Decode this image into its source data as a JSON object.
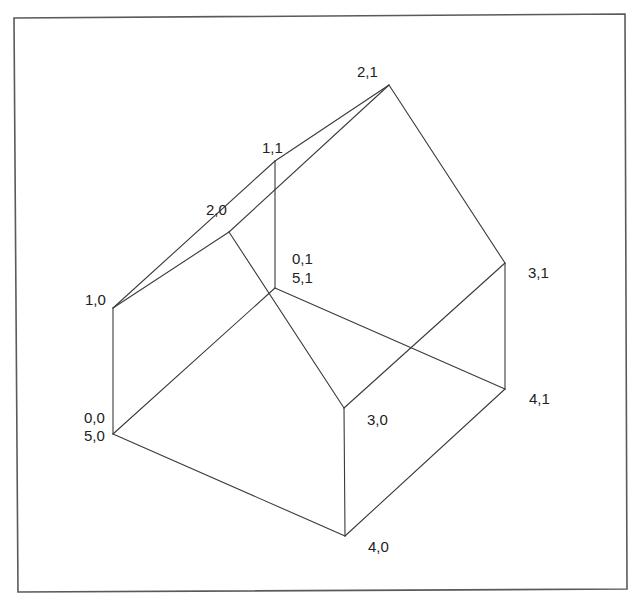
{
  "diagram": {
    "type": "wireframe-3d-house",
    "frame": {
      "points": [
        [
          14,
          18
        ],
        [
          625,
          14
        ],
        [
          627,
          589
        ],
        [
          18,
          592
        ]
      ],
      "stroke": "#5a5a5a"
    },
    "line_color": "#3a3a3a",
    "text_color": "#222222",
    "vertices": [
      {
        "id": "0,0",
        "x": 113,
        "y": 434
      },
      {
        "id": "1,0",
        "x": 113,
        "y": 308
      },
      {
        "id": "2,0",
        "x": 229,
        "y": 232
      },
      {
        "id": "3,0",
        "x": 344,
        "y": 408
      },
      {
        "id": "4,0",
        "x": 345,
        "y": 536
      },
      {
        "id": "0,1",
        "x": 275,
        "y": 288
      },
      {
        "id": "1,1",
        "x": 275,
        "y": 161
      },
      {
        "id": "2,1",
        "x": 389,
        "y": 85
      },
      {
        "id": "3,1",
        "x": 505,
        "y": 263
      },
      {
        "id": "4,1",
        "x": 505,
        "y": 389
      }
    ],
    "edges": [
      [
        "0,0",
        "1,0"
      ],
      [
        "1,0",
        "2,0"
      ],
      [
        "2,0",
        "3,0"
      ],
      [
        "3,0",
        "4,0"
      ],
      [
        "4,0",
        "0,0"
      ],
      [
        "0,1",
        "1,1"
      ],
      [
        "1,1",
        "2,1"
      ],
      [
        "2,1",
        "3,1"
      ],
      [
        "3,1",
        "4,1"
      ],
      [
        "4,1",
        "0,1"
      ],
      [
        "0,0",
        "0,1"
      ],
      [
        "1,0",
        "1,1"
      ],
      [
        "2,0",
        "2,1"
      ],
      [
        "3,0",
        "3,1"
      ],
      [
        "4,0",
        "4,1"
      ]
    ],
    "labels": [
      {
        "text": "1,0",
        "x": 85,
        "y": 305
      },
      {
        "text": "0,0",
        "x": 84,
        "y": 423
      },
      {
        "text": "5,0",
        "x": 84,
        "y": 441
      },
      {
        "text": "2,0",
        "x": 206,
        "y": 215
      },
      {
        "text": "1,1",
        "x": 262,
        "y": 153
      },
      {
        "text": "0,1",
        "x": 292,
        "y": 264
      },
      {
        "text": "5,1",
        "x": 292,
        "y": 283
      },
      {
        "text": "2,1",
        "x": 357,
        "y": 77
      },
      {
        "text": "3,1",
        "x": 528,
        "y": 278
      },
      {
        "text": "3,0",
        "x": 367,
        "y": 425
      },
      {
        "text": "4,1",
        "x": 529,
        "y": 404
      },
      {
        "text": "4,0",
        "x": 368,
        "y": 552
      }
    ]
  }
}
